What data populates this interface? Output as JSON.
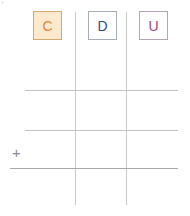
{
  "worksheet": {
    "title": "Place value column worksheet",
    "background_color": "#ffffff",
    "width": 190,
    "height": 216
  },
  "columns": {
    "headers": [
      {
        "label": "C",
        "name": "hundreds",
        "fill_color": "#fce9ce",
        "border_color": "#d5a86f",
        "text_color": "#e4863a",
        "highlighted": "true",
        "x": 33,
        "y": 11
      },
      {
        "label": "D",
        "name": "tens",
        "fill_color": "#ffffff",
        "border_color": "#a8adbd",
        "text_color": "#2f4a7c",
        "highlighted": "false",
        "x": 88,
        "y": 11
      },
      {
        "label": "U",
        "name": "units",
        "fill_color": "#ffffff",
        "border_color": "#b5a5b5",
        "text_color": "#97477c",
        "highlighted": "false",
        "x": 139,
        "y": 11
      }
    ]
  },
  "grid": {
    "line_color": "#c4c4c4",
    "rule_color": "#a8a8a8",
    "vertical_lines": [
      {
        "name": "divider-hundreds-tens",
        "x": 75,
        "top": 12,
        "bottom": 205
      },
      {
        "name": "divider-tens-units",
        "x": 126,
        "top": 12,
        "bottom": 205
      }
    ],
    "horizontal_lines": [
      {
        "name": "row-line-1",
        "y": 90,
        "left": 25,
        "right": 178
      },
      {
        "name": "row-line-2",
        "y": 130,
        "left": 25,
        "right": 178
      },
      {
        "name": "total-rule",
        "y": 168,
        "left": 10,
        "right": 178
      }
    ]
  },
  "operator": {
    "symbol": "+",
    "name": "addition",
    "color": "#8c8c8c",
    "x": 12,
    "y": 145
  },
  "entries": {
    "row_1": {
      "hundreds": "",
      "tens": "",
      "units": ""
    },
    "row_2": {
      "hundreds": "",
      "tens": "",
      "units": ""
    },
    "sum": {
      "hundreds": "",
      "tens": "",
      "units": ""
    }
  }
}
